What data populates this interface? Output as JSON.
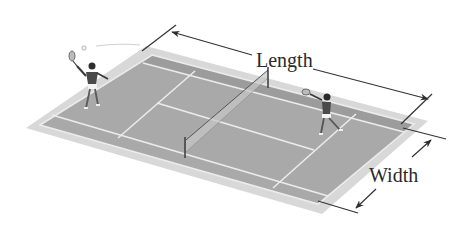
{
  "diagram": {
    "labels": {
      "length": "Length",
      "width": "Width"
    },
    "colors": {
      "surround": "#d4d4d4",
      "court": "#a8a8a8",
      "court_dark": "#9a9a9a",
      "lines": "#e6e6e6",
      "dimension_lines": "#3a3a3a",
      "text": "#2a2a2a"
    },
    "elements": [
      {
        "name": "court",
        "description": "Gray tennis court surface with white boundary and service lines"
      },
      {
        "name": "net",
        "description": "Net spanning width of court at center"
      },
      {
        "name": "player-left",
        "description": "Player serving with racket raised, ball in air"
      },
      {
        "name": "player-right",
        "description": "Player returning with racket"
      },
      {
        "name": "length-dimension",
        "description": "Arrow line indicating length of court"
      },
      {
        "name": "width-dimension",
        "description": "Arrow line indicating width of court"
      }
    ]
  }
}
